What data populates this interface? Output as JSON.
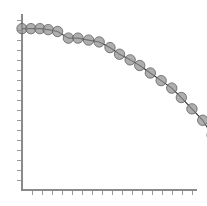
{
  "figure": {
    "background_color": "#ffffff",
    "width": 207,
    "height": 206
  },
  "axes": {
    "line_color": "#8a8a8a",
    "tick_color": "#9a9a9a",
    "origin_x": 22,
    "origin_y": 190,
    "right_edge": 197,
    "top_edge": 14,
    "x_tick_count": 17,
    "y_tick_count": 17,
    "x_tick_length": 5,
    "y_tick_length": 5,
    "x_tick_spacing": 10,
    "y_tick_spacing": 10,
    "grid": "off",
    "x_tick_labels": [],
    "y_tick_labels": []
  },
  "chart_data": {
    "type": "line",
    "title": "",
    "subtitle": "",
    "xlabel": "",
    "ylabel": "",
    "xlim": [
      0,
      1
    ],
    "ylim": [
      0,
      1
    ],
    "grid": false,
    "legend": "none",
    "legend_entries": [],
    "annotations": [],
    "marker": {
      "shape": "circle",
      "radius_px": 5.2,
      "fill_color": "#8f8f8f",
      "fill_opacity": 0.72,
      "edge_color": "#5a5a5a"
    },
    "line": {
      "color": "#2e2e2e",
      "width_px": 1.1,
      "style": "solid"
    },
    "series": [
      {
        "name": "decay-curve",
        "x": [
          0.0,
          0.043,
          0.086,
          0.126,
          0.171,
          0.223,
          0.269,
          0.32,
          0.371,
          0.423,
          0.469,
          0.52,
          0.566,
          0.617,
          0.669,
          0.72,
          0.766,
          0.817,
          0.869,
          0.914,
          0.96,
          1.0
        ],
        "y": [
          0.972,
          0.972,
          0.972,
          0.966,
          0.955,
          0.915,
          0.915,
          0.903,
          0.892,
          0.858,
          0.818,
          0.784,
          0.75,
          0.705,
          0.659,
          0.614,
          0.557,
          0.489,
          0.42,
          0.33,
          0.205,
          0.0
        ]
      }
    ],
    "points_px": [
      [
        23,
        24
      ],
      [
        32,
        24
      ],
      [
        41,
        24
      ],
      [
        49,
        25
      ],
      [
        58,
        27
      ],
      [
        69,
        34
      ],
      [
        78,
        34
      ],
      [
        89,
        36
      ],
      [
        100,
        38
      ],
      [
        111,
        44
      ],
      [
        120,
        51
      ],
      [
        131,
        57
      ],
      [
        140,
        63
      ],
      [
        151,
        71
      ],
      [
        162,
        79
      ],
      [
        173,
        87
      ],
      [
        182,
        97
      ],
      [
        193,
        109
      ],
      [
        204,
        121
      ],
      [
        213,
        137
      ],
      [
        222,
        159
      ],
      [
        230,
        190
      ]
    ],
    "point_count": 22
  }
}
